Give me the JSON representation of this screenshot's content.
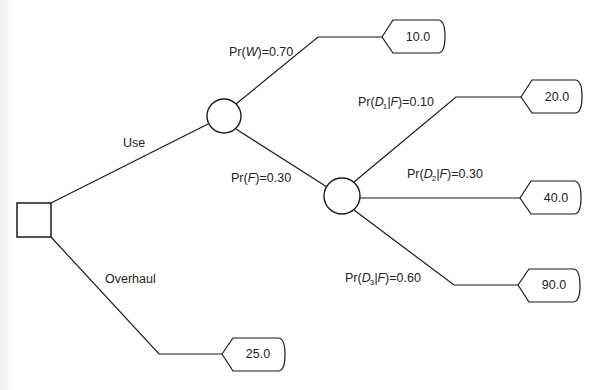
{
  "diagram": {
    "type": "decision-tree",
    "decision_node": {
      "shape": "square"
    },
    "branches": {
      "use": {
        "label": "Use"
      },
      "overhaul": {
        "label": "Overhaul",
        "payoff": "25.0"
      }
    },
    "chance_node_1": {
      "outcomes": [
        {
          "prob_prefix": "Pr(",
          "event": "W",
          "prob_suffix": ")=0.70",
          "payoff": "10.0"
        },
        {
          "prob_prefix": "Pr(",
          "event": "F",
          "prob_suffix": ")=0.30"
        }
      ]
    },
    "chance_node_2": {
      "outcomes": [
        {
          "prob_prefix": "Pr(",
          "event": "D",
          "sub": "1",
          "given": "|F",
          "prob_suffix": ")=0.10",
          "payoff": "20.0"
        },
        {
          "prob_prefix": "Pr(",
          "event": "D",
          "sub": "2",
          "given": "|F",
          "prob_suffix": ")=0.30",
          "payoff": "40.0"
        },
        {
          "prob_prefix": "Pr(",
          "event": "D",
          "sub": "3",
          "given": "|F",
          "prob_suffix": ")=0.60",
          "payoff": "90.0"
        }
      ]
    }
  }
}
